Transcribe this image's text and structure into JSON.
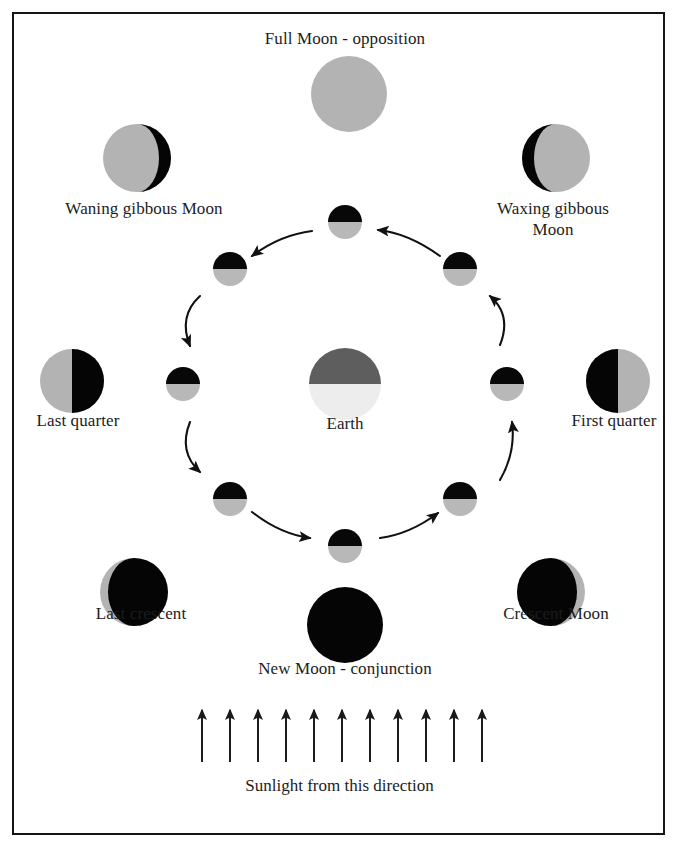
{
  "figure": {
    "background_color": "#ffffff",
    "border_color": "#141414",
    "text_color": "#1c1c1c"
  },
  "colors": {
    "moon_lit": "#b3b3b3",
    "moon_dark": "#050505",
    "earth_night": "#5e5e5e",
    "earth_day": "#ededed",
    "arrow": "#111111",
    "small_moon_dark": "#080808",
    "small_moon_lit": "#b8b8b8"
  },
  "center": {
    "earth_label": "Earth",
    "earth_cx": 345,
    "earth_cy": 384,
    "earth_r": 36,
    "night_side": "top",
    "day_side": "bottom"
  },
  "orbit": {
    "cx": 345,
    "cy": 384,
    "radius": 162,
    "small_moon_r": 17,
    "direction": "counterclockwise",
    "positions_deg": [
      90,
      135,
      180,
      225,
      270,
      315,
      0,
      45
    ],
    "moons": [
      {
        "name": "orbit-moon-top",
        "cx": 345,
        "cy": 222,
        "dark_half": "top"
      },
      {
        "name": "orbit-moon-upper-left",
        "cx": 230,
        "cy": 269,
        "dark_half": "top"
      },
      {
        "name": "orbit-moon-left",
        "cx": 183,
        "cy": 384,
        "dark_half": "top"
      },
      {
        "name": "orbit-moon-lower-left",
        "cx": 230,
        "cy": 499,
        "dark_half": "top"
      },
      {
        "name": "orbit-moon-bottom",
        "cx": 345,
        "cy": 546,
        "dark_half": "top"
      },
      {
        "name": "orbit-moon-lower-right",
        "cx": 460,
        "cy": 499,
        "dark_half": "top"
      },
      {
        "name": "orbit-moon-right",
        "cx": 507,
        "cy": 384,
        "dark_half": "top"
      },
      {
        "name": "orbit-moon-upper-right",
        "cx": 460,
        "cy": 269,
        "dark_half": "top"
      }
    ]
  },
  "phases": [
    {
      "id": "full-moon",
      "label": "Full Moon - opposition",
      "label_x": 345,
      "label_y": 40,
      "disc_cx": 349,
      "disc_cy": 94,
      "disc_r": 38,
      "illumination": "full",
      "terminator": "none"
    },
    {
      "id": "waning-gibbous-moon",
      "label": "Waning gibbous Moon",
      "label_x": 144,
      "label_y": 210,
      "disc_cx": 137,
      "disc_cy": 158,
      "disc_r": 34,
      "illumination": "gibbous",
      "dark_side": "right",
      "dark_fraction": 0.22
    },
    {
      "id": "waxing-gibbous-moon",
      "label": "Waxing gibbous\nMoon",
      "label_x": 553,
      "label_y": 210,
      "disc_cx": 556,
      "disc_cy": 158,
      "disc_r": 34,
      "illumination": "gibbous",
      "dark_side": "left",
      "dark_fraction": 0.22
    },
    {
      "id": "last-quarter",
      "label": "Last quarter",
      "label_x": 78,
      "label_y": 421,
      "disc_cx": 72,
      "disc_cy": 381,
      "disc_r": 32,
      "illumination": "half",
      "dark_side": "right",
      "dark_fraction": 0.5
    },
    {
      "id": "first-quarter",
      "label": "First quarter",
      "label_x": 614,
      "label_y": 421,
      "disc_cx": 618,
      "disc_cy": 381,
      "disc_r": 32,
      "illumination": "half",
      "dark_side": "left",
      "dark_fraction": 0.5
    },
    {
      "id": "last-crescent",
      "label": "Last crescent",
      "label_x": 141,
      "label_y": 614,
      "disc_cx": 134,
      "disc_cy": 592,
      "disc_r": 34,
      "illumination": "crescent",
      "lit_side": "left",
      "lit_fraction": 0.18
    },
    {
      "id": "crescent-moon",
      "label": "Crescent Moon",
      "label_x": 556,
      "label_y": 614,
      "disc_cx": 551,
      "disc_cy": 592,
      "disc_r": 34,
      "illumination": "crescent",
      "lit_side": "right",
      "lit_fraction": 0.18
    },
    {
      "id": "new-moon",
      "label": "New Moon - conjunction",
      "label_x": 345,
      "label_y": 668,
      "disc_cx": 345,
      "disc_cy": 625,
      "disc_r": 38,
      "illumination": "new",
      "terminator": "none"
    }
  ],
  "sunlight": {
    "caption": "Sunlight from this direction",
    "caption_y": 775,
    "direction": "upward",
    "arrow_count": 11,
    "arrow_first_x": 202,
    "arrow_spacing": 28,
    "arrow_top_y": 710,
    "arrow_bottom_y": 762
  },
  "orbit_arrows": [
    {
      "name": "orbit-arrow-top-right",
      "from_deg": 55,
      "to_deg": 80
    },
    {
      "name": "orbit-arrow-top-left",
      "from_deg": 100,
      "to_deg": 128
    },
    {
      "name": "orbit-arrow-upper-left",
      "from_deg": 148,
      "to_deg": 172
    },
    {
      "name": "orbit-arrow-lower-left",
      "from_deg": 192,
      "to_deg": 216
    },
    {
      "name": "orbit-arrow-bottom-left",
      "from_deg": 238,
      "to_deg": 262
    },
    {
      "name": "orbit-arrow-bottom-right",
      "from_deg": 282,
      "to_deg": 305
    },
    {
      "name": "orbit-arrow-right",
      "from_deg": 326,
      "to_deg": 350
    }
  ]
}
